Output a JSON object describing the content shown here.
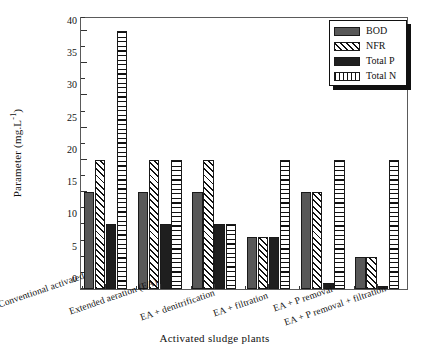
{
  "chart_data": {
    "type": "bar",
    "title": "",
    "xlabel": "Activated sludge plants",
    "ylabel": "Parameter (mg.L",
    "ylabel_sup": "-1",
    "ylabel_suffix": ")",
    "ylim": [
      0,
      42
    ],
    "ytick_values": [
      0,
      5,
      10,
      15,
      20,
      25,
      30,
      35,
      40
    ],
    "ytick_labels": [
      "0",
      "5",
      "10",
      "15",
      "20",
      "25",
      "30",
      "35",
      "40"
    ],
    "yminor_values": [
      2.5,
      7.5,
      12.5,
      17.5,
      22.5,
      27.5,
      32.5,
      37.5,
      42
    ],
    "grid": false,
    "legend_position": "top-right",
    "categories": [
      "Conventional activated",
      "Extended aeration (EA)",
      "EA + denitrification",
      "EA + filtration",
      "EA + P removal",
      "EA + P removal + filtration"
    ],
    "series": [
      {
        "name": "BOD",
        "key": "s0",
        "pattern": "solid-gray",
        "color": "#585858",
        "values": [
          15,
          15,
          15,
          8,
          15,
          5
        ]
      },
      {
        "name": "NFR",
        "key": "s1",
        "pattern": "diagonal-hatch",
        "color": "#ffffff",
        "values": [
          20,
          20,
          20,
          8,
          15,
          5
        ]
      },
      {
        "name": "Total P",
        "key": "s2",
        "pattern": "solid-black",
        "color": "#1f1f1f",
        "values": [
          10,
          10,
          10,
          8,
          1,
          0.5
        ]
      },
      {
        "name": "Total N",
        "key": "s3",
        "pattern": "horizontal-lines",
        "color": "#ffffff",
        "values": [
          40,
          20,
          10,
          20,
          20,
          20
        ]
      }
    ]
  },
  "legend": {
    "items": [
      {
        "label": "BOD"
      },
      {
        "label": "NFR"
      },
      {
        "label": "Total P"
      },
      {
        "label": "Total N"
      }
    ]
  }
}
